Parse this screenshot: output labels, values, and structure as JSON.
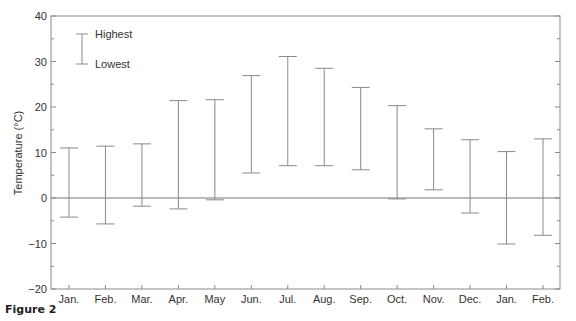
{
  "caption": "Figure 2",
  "colors": {
    "line": "#8a8a8a",
    "axis": "#8a8a8a",
    "text": "#333333"
  },
  "chart_data": {
    "type": "range_bar",
    "title": "",
    "xlabel": "",
    "ylabel": "Temperature (°C)",
    "ylim": [
      -20,
      40
    ],
    "yticks": [
      40,
      30,
      20,
      10,
      0,
      -10,
      -20
    ],
    "ytick_labels": [
      "40",
      "30",
      "20",
      "10",
      "0",
      "−10",
      "−20"
    ],
    "minor_ytick_step": 5,
    "grid": false,
    "zero_line": true,
    "legend": {
      "position": "top-left",
      "entries": [
        "Highest",
        "Lowest"
      ]
    },
    "categories": [
      "Jan.",
      "Feb.",
      "Mar.",
      "Apr.",
      "May",
      "Jun.",
      "Jul.",
      "Aug.",
      "Sep.",
      "Oct.",
      "Nov.",
      "Dec.",
      "Jan.",
      "Feb."
    ],
    "series": [
      {
        "name": "Highest",
        "values": [
          11.0,
          11.4,
          11.9,
          21.4,
          21.6,
          26.9,
          31.1,
          28.5,
          24.3,
          20.3,
          15.2,
          12.8,
          10.2,
          13.0
        ]
      },
      {
        "name": "Lowest",
        "values": [
          -4.2,
          -5.7,
          -1.8,
          -2.4,
          -0.4,
          5.5,
          7.1,
          7.1,
          6.2,
          -0.2,
          1.8,
          -3.3,
          -10.1,
          -8.2
        ]
      }
    ]
  }
}
